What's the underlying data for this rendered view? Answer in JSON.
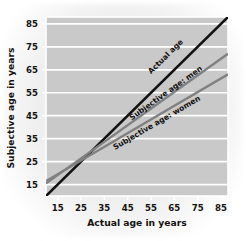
{
  "chart_data": {
    "type": "line",
    "title": "",
    "xlabel": "Actual age in years",
    "ylabel": "Subjective age in years",
    "xlim": [
      10,
      88
    ],
    "ylim": [
      10,
      88
    ],
    "xticks": [
      15,
      25,
      35,
      45,
      55,
      65,
      75,
      85
    ],
    "yticks": [
      15,
      25,
      35,
      45,
      55,
      65,
      75,
      85
    ],
    "xtick_labels": [
      "15",
      "25",
      "35",
      "45",
      "55",
      "65",
      "75",
      "85"
    ],
    "ytick_labels": [
      "15",
      "25",
      "35",
      "45",
      "55",
      "65",
      "75",
      "85"
    ],
    "grid": "horizontal",
    "grid_color": "#ffffff",
    "plot_bgcolor": "#c9c9c9",
    "legend_position": "inline-labels",
    "series": [
      {
        "name": "Actual age",
        "label": "Actual age",
        "color": "#111111",
        "x": [
          10,
          88
        ],
        "values": [
          10,
          88
        ],
        "label_x": 62,
        "label_y": 70
      },
      {
        "name": "Subjective age: men",
        "label": "Subjective age: men",
        "color": "#808080",
        "x": [
          10,
          88
        ],
        "values": [
          15.5,
          72
        ],
        "label_x": 62,
        "label_y": 54
      },
      {
        "name": "Subjective age: women",
        "label": "Subjective age: women",
        "color": "#808080",
        "x": [
          10,
          88
        ],
        "values": [
          16.5,
          63
        ],
        "label_x": 58,
        "label_y": 41
      }
    ]
  }
}
